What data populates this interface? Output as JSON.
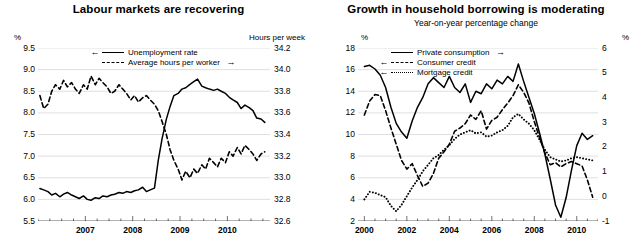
{
  "charts": [
    {
      "title": "Labour markets are recovering",
      "subtitle": "",
      "left_unit": "%",
      "right_unit": "Hours per week",
      "legend": [
        {
          "label": "Unemployment rate",
          "style": "solid",
          "arrow_left": "←",
          "arrow_right": ""
        },
        {
          "label": "Average hours per worker",
          "style": "dash",
          "arrow_left": "",
          "arrow_right": "→"
        }
      ],
      "chart_data": {
        "type": "line",
        "title": "Labour markets are recovering",
        "xlabel": "",
        "ylabel": "%",
        "y2label": "Hours per week",
        "grid": true,
        "legend_position": "top-center",
        "xlim": [
          2006.0,
          2010.9
        ],
        "xticks": [
          2007,
          2008,
          2009,
          2010
        ],
        "xtick_labels": [
          "2007",
          "2008",
          "2009",
          "2010"
        ],
        "ylim": [
          5.5,
          9.5
        ],
        "yticks": [
          5.5,
          6.0,
          6.5,
          7.0,
          7.5,
          8.0,
          8.5,
          9.0,
          9.5
        ],
        "ytick_labels": [
          "5.5",
          "6.0",
          "6.5",
          "7.0",
          "7.5",
          "8.0",
          "8.5",
          "9.0",
          "9.5"
        ],
        "y2lim": [
          32.6,
          34.2
        ],
        "y2ticks": [
          32.6,
          32.8,
          33.0,
          33.2,
          33.4,
          33.6,
          33.8,
          34.0,
          34.2
        ],
        "y2tick_labels": [
          "32.6",
          "32.8",
          "33.0",
          "33.2",
          "33.4",
          "33.6",
          "33.8",
          "34.0",
          "34.2"
        ],
        "series": [
          {
            "name": "Unemployment rate",
            "axis": "left",
            "style": "solid",
            "x": [
              2006.04,
              2006.12,
              2006.21,
              2006.29,
              2006.37,
              2006.46,
              2006.54,
              2006.62,
              2006.71,
              2006.79,
              2006.87,
              2006.96,
              2007.04,
              2007.12,
              2007.21,
              2007.29,
              2007.37,
              2007.46,
              2007.54,
              2007.62,
              2007.71,
              2007.79,
              2007.87,
              2007.96,
              2008.04,
              2008.12,
              2008.21,
              2008.29,
              2008.37,
              2008.46,
              2008.54,
              2008.62,
              2008.71,
              2008.79,
              2008.87,
              2008.96,
              2009.04,
              2009.12,
              2009.21,
              2009.29,
              2009.37,
              2009.46,
              2009.54,
              2009.62,
              2009.71,
              2009.79,
              2009.87,
              2009.96,
              2010.04,
              2010.12,
              2010.21,
              2010.29,
              2010.37,
              2010.46,
              2010.54,
              2010.62,
              2010.71,
              2010.79
            ],
            "y": [
              6.25,
              6.22,
              6.18,
              6.1,
              6.14,
              6.06,
              6.12,
              6.16,
              6.1,
              6.06,
              6.02,
              6.08,
              6.0,
              5.98,
              6.04,
              6.02,
              6.08,
              6.06,
              6.1,
              6.12,
              6.16,
              6.14,
              6.18,
              6.16,
              6.2,
              6.22,
              6.28,
              6.18,
              6.22,
              6.26,
              6.9,
              7.4,
              7.85,
              8.15,
              8.4,
              8.45,
              8.55,
              8.58,
              8.66,
              8.72,
              8.78,
              8.62,
              8.58,
              8.55,
              8.52,
              8.55,
              8.5,
              8.45,
              8.36,
              8.3,
              8.24,
              8.1,
              8.18,
              8.12,
              8.05,
              7.88,
              7.86,
              7.78
            ]
          },
          {
            "name": "Average hours per worker",
            "axis": "right",
            "style": "dash",
            "x": [
              2006.04,
              2006.12,
              2006.21,
              2006.29,
              2006.37,
              2006.46,
              2006.54,
              2006.62,
              2006.71,
              2006.79,
              2006.87,
              2006.96,
              2007.04,
              2007.12,
              2007.21,
              2007.29,
              2007.37,
              2007.46,
              2007.54,
              2007.62,
              2007.71,
              2007.79,
              2007.87,
              2007.96,
              2008.04,
              2008.12,
              2008.21,
              2008.29,
              2008.37,
              2008.46,
              2008.54,
              2008.62,
              2008.71,
              2008.79,
              2008.87,
              2008.96,
              2009.04,
              2009.12,
              2009.21,
              2009.29,
              2009.37,
              2009.46,
              2009.54,
              2009.62,
              2009.71,
              2009.79,
              2009.87,
              2009.96,
              2010.04,
              2010.12,
              2010.21,
              2010.29,
              2010.37,
              2010.46,
              2010.54,
              2010.62,
              2010.71,
              2010.79
            ],
            "y": [
              33.76,
              33.64,
              33.68,
              33.8,
              33.86,
              33.82,
              33.9,
              33.84,
              33.88,
              33.82,
              33.78,
              33.86,
              33.82,
              33.94,
              33.86,
              33.92,
              33.88,
              33.84,
              33.78,
              33.8,
              33.86,
              33.82,
              33.78,
              33.72,
              33.76,
              33.7,
              33.74,
              33.76,
              33.72,
              33.68,
              33.62,
              33.52,
              33.4,
              33.26,
              33.16,
              33.08,
              32.98,
              33.06,
              33.0,
              33.08,
              33.04,
              33.12,
              33.08,
              33.18,
              33.14,
              33.1,
              33.18,
              33.14,
              33.24,
              33.2,
              33.28,
              33.22,
              33.3,
              33.26,
              33.22,
              33.16,
              33.22,
              33.24
            ]
          }
        ]
      }
    },
    {
      "title": "Growth in household borrowing is moderating",
      "subtitle": "Year-on-year percentage change",
      "left_unit": "%",
      "right_unit": "%",
      "legend": [
        {
          "label": "Private consumption",
          "style": "solid",
          "arrow_left": "",
          "arrow_right": "→"
        },
        {
          "label": "Consumer credit",
          "style": "dash",
          "arrow_left": "←",
          "arrow_right": ""
        },
        {
          "label": "Mortgage credit",
          "style": "dot",
          "arrow_left": "←",
          "arrow_right": ""
        }
      ],
      "chart_data": {
        "type": "line",
        "title": "Growth in household borrowing is moderating",
        "subtitle": "Year-on-year percentage change",
        "xlabel": "",
        "ylabel": "%",
        "y2label": "%",
        "grid": true,
        "legend_position": "top-center",
        "xlim": [
          1999.7,
          2011.0
        ],
        "xticks": [
          2000,
          2002,
          2004,
          2006,
          2008,
          2010
        ],
        "xtick_labels": [
          "2000",
          "2002",
          "2004",
          "2006",
          "2008",
          "2010"
        ],
        "ylim": [
          2,
          18
        ],
        "yticks": [
          2,
          4,
          6,
          8,
          10,
          12,
          14,
          16,
          18
        ],
        "ytick_labels": [
          "2",
          "4",
          "6",
          "8",
          "10",
          "12",
          "14",
          "16",
          "18"
        ],
        "y2lim": [
          -1,
          6
        ],
        "y2ticks": [
          -1,
          0,
          1,
          2,
          3,
          4,
          5,
          6
        ],
        "y2tick_labels": [
          "-1",
          "0",
          "1",
          "2",
          "3",
          "4",
          "5",
          "6"
        ],
        "series": [
          {
            "name": "Private consumption",
            "axis": "right",
            "style": "solid",
            "x": [
              2000.0,
              2000.25,
              2000.5,
              2000.75,
              2001.0,
              2001.25,
              2001.5,
              2001.75,
              2002.0,
              2002.25,
              2002.5,
              2002.75,
              2003.0,
              2003.25,
              2003.5,
              2003.75,
              2004.0,
              2004.25,
              2004.5,
              2004.75,
              2005.0,
              2005.25,
              2005.5,
              2005.75,
              2006.0,
              2006.25,
              2006.5,
              2006.75,
              2007.0,
              2007.25,
              2007.5,
              2007.75,
              2008.0,
              2008.25,
              2008.5,
              2008.75,
              2009.0,
              2009.25,
              2009.5,
              2009.75,
              2010.0,
              2010.25,
              2010.5,
              2010.75
            ],
            "y": [
              5.25,
              5.3,
              5.15,
              4.9,
              4.4,
              3.6,
              2.95,
              2.6,
              2.35,
              3.05,
              3.6,
              4.0,
              4.55,
              4.8,
              4.6,
              4.4,
              4.85,
              4.4,
              4.2,
              4.55,
              3.8,
              4.25,
              4.15,
              4.55,
              4.35,
              4.7,
              4.55,
              4.85,
              4.65,
              5.35,
              4.65,
              4.0,
              3.35,
              2.55,
              1.7,
              0.7,
              -0.35,
              -0.85,
              -0.05,
              1.05,
              2.05,
              2.55,
              2.3,
              2.45
            ]
          },
          {
            "name": "Consumer credit",
            "axis": "left",
            "style": "dash",
            "x": [
              2000.0,
              2000.25,
              2000.5,
              2000.75,
              2001.0,
              2001.25,
              2001.5,
              2001.75,
              2002.0,
              2002.25,
              2002.5,
              2002.75,
              2003.0,
              2003.25,
              2003.5,
              2003.75,
              2004.0,
              2004.25,
              2004.5,
              2004.75,
              2005.0,
              2005.25,
              2005.5,
              2005.75,
              2006.0,
              2006.25,
              2006.5,
              2006.75,
              2007.0,
              2007.25,
              2007.5,
              2007.75,
              2008.0,
              2008.25,
              2008.5,
              2008.75,
              2009.0,
              2009.25,
              2009.5,
              2009.75,
              2010.0,
              2010.25,
              2010.5,
              2010.75
            ],
            "y": [
              11.8,
              13.1,
              13.7,
              13.6,
              12.2,
              10.6,
              9.1,
              7.6,
              6.8,
              7.3,
              6.2,
              5.2,
              5.5,
              6.4,
              7.8,
              8.4,
              9.1,
              10.3,
              10.6,
              11.0,
              11.8,
              11.4,
              12.2,
              10.5,
              11.3,
              11.6,
              12.3,
              12.9,
              13.6,
              14.6,
              13.9,
              12.9,
              11.2,
              9.7,
              8.3,
              7.2,
              7.4,
              7.0,
              7.3,
              7.5,
              7.3,
              7.1,
              5.8,
              4.2
            ]
          },
          {
            "name": "Mortgage credit",
            "axis": "left",
            "style": "dot",
            "x": [
              2000.0,
              2000.25,
              2000.5,
              2000.75,
              2001.0,
              2001.25,
              2001.5,
              2001.75,
              2002.0,
              2002.25,
              2002.5,
              2002.75,
              2003.0,
              2003.25,
              2003.5,
              2003.75,
              2004.0,
              2004.25,
              2004.5,
              2004.75,
              2005.0,
              2005.25,
              2005.5,
              2005.75,
              2006.0,
              2006.25,
              2006.5,
              2006.75,
              2007.0,
              2007.25,
              2007.5,
              2007.75,
              2008.0,
              2008.25,
              2008.5,
              2008.75,
              2009.0,
              2009.25,
              2009.5,
              2009.75,
              2010.0,
              2010.25,
              2010.5,
              2010.75
            ],
            "y": [
              4.0,
              4.7,
              4.6,
              4.4,
              4.2,
              3.4,
              2.9,
              3.5,
              4.3,
              5.1,
              5.8,
              6.6,
              7.2,
              7.8,
              8.1,
              8.6,
              9.0,
              9.6,
              10.0,
              10.2,
              10.4,
              10.1,
              10.2,
              9.8,
              9.9,
              10.2,
              10.4,
              10.8,
              11.6,
              11.9,
              11.4,
              11.0,
              10.4,
              9.5,
              8.6,
              7.9,
              7.7,
              7.5,
              7.6,
              7.8,
              7.9,
              7.8,
              7.7,
              7.6
            ]
          }
        ]
      }
    }
  ]
}
